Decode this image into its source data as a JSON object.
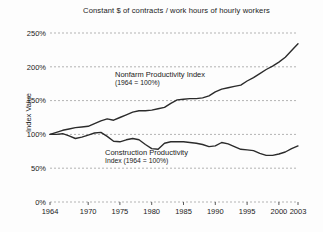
{
  "title": "Constant $ of contracts / work hours of hourly workers",
  "ylabel": "Index Value",
  "annotations": {
    "nonfarm_line1": "Nonfarm Productivity Index",
    "nonfarm_line2": "(1964 = 100%)",
    "construction_line1": "Construction Productivity",
    "construction_line2": "Index (1964 = 100%)"
  },
  "colors": {
    "background": "#fdfdfd",
    "line": "#2b2b2b",
    "grid": "#b3b3b3",
    "text": "#1a1a1a"
  },
  "chart_data": {
    "type": "line",
    "title": "Constant $ of contracts / work hours of hourly workers",
    "xlabel": "",
    "ylabel": "Index Value",
    "xlim": [
      1964,
      2003
    ],
    "ylim": [
      0,
      250
    ],
    "grid": "horizontal dashed",
    "legend_position": "inline annotations",
    "x_tick_labels": [
      "1964",
      "1970",
      "1975",
      "1980",
      "1985",
      "1990",
      "1995",
      "2000",
      "2003"
    ],
    "y_tick_labels": [
      "0%",
      "50%",
      "100%",
      "150%",
      "200%",
      "250%"
    ],
    "x": [
      1964,
      1965,
      1966,
      1967,
      1968,
      1969,
      1970,
      1971,
      1972,
      1973,
      1974,
      1975,
      1976,
      1977,
      1978,
      1979,
      1980,
      1981,
      1982,
      1983,
      1984,
      1985,
      1986,
      1987,
      1988,
      1989,
      1990,
      1991,
      1992,
      1993,
      1994,
      1995,
      1996,
      1997,
      1998,
      1999,
      2000,
      2001,
      2002,
      2003
    ],
    "series": [
      {
        "id": "nonfarm",
        "name": "Nonfarm Productivity Index (1964 = 100%)",
        "unit": "%",
        "values": [
          100,
          103,
          106,
          108,
          110,
          111,
          112,
          116,
          120,
          123,
          121,
          125,
          129,
          133,
          135,
          135,
          136,
          138,
          140,
          146,
          151,
          152,
          153,
          153,
          154,
          157,
          163,
          167,
          169,
          171,
          173,
          179,
          184,
          190,
          196,
          201,
          207,
          214,
          224,
          234
        ]
      },
      {
        "id": "construction",
        "name": "Construction Productivity Index (1964 = 100%)",
        "unit": "%",
        "values": [
          100,
          100,
          101,
          98,
          94,
          96,
          99,
          102,
          103,
          97,
          90,
          89,
          92,
          94,
          92,
          85,
          79,
          78,
          87,
          89,
          89,
          89,
          88,
          87,
          85,
          82,
          83,
          88,
          86,
          82,
          78,
          77,
          76,
          72,
          69,
          69,
          71,
          74,
          79,
          83
        ]
      }
    ]
  }
}
